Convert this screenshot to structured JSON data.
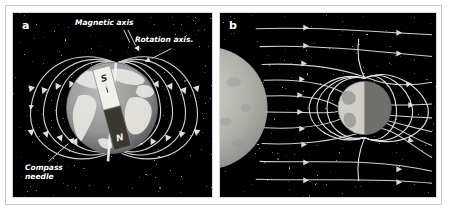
{
  "figure": {
    "background": "#ffffff",
    "frame_color": "#c9c9c9",
    "panel_background": "#000000",
    "fieldline_color": "#d5d5d5"
  },
  "panels": [
    {
      "letter": "a",
      "name": "earth-dipole-field",
      "callouts": [
        {
          "id": "magnetic-axis",
          "text": "Magnetic axis"
        },
        {
          "id": "rotation-axis",
          "text": "Rotation axis."
        },
        {
          "id": "compass-needle",
          "text": "Compass needle"
        }
      ],
      "bar_magnet": {
        "north_label": "N",
        "south_label": "S",
        "south_fill": "#f2f0ea",
        "north_fill": "#3a3632",
        "tilt_degrees": -15
      },
      "earth": {
        "ocean_color": "#8c8c8c",
        "land_color": "#e8e6e0"
      }
    },
    {
      "letter": "b",
      "name": "magnetosphere-solar-wind",
      "sun": {
        "color": "#b5b5b0",
        "name": "sun"
      },
      "earth": {
        "day_color": "#cfcdc6",
        "night_color": "#6b6b68"
      },
      "solar_wind": {
        "stream_count": 11,
        "arrow_color": "#d5d5d5"
      }
    }
  ]
}
